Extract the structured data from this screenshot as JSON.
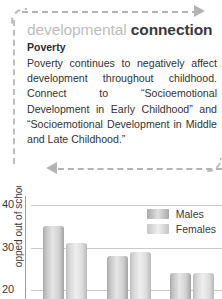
{
  "callout": {
    "heading_light": "developmental",
    "heading_bold": "connection",
    "subheading": "Poverty",
    "body": "Poverty continues to negatively affect development throughout childhood. Connect to “Socioemotional Development in Early Childhood” and “Socioemotional Development in Middle and Late Childhood.”",
    "arrow_top": "dashed-arrow-right",
    "arrow_bottom": "dashed-arrow-left",
    "border_color": "#bdbdbd"
  },
  "chart_data": {
    "type": "bar",
    "title": "",
    "xlabel": "",
    "ylabel": "opped out of school",
    "ylabel_full": "dropped out of school",
    "categories": [
      "Group 1",
      "Group 2",
      "Group 3"
    ],
    "series": [
      {
        "name": "Males",
        "values": [
          35,
          28,
          24
        ],
        "color": "#b0b0b0"
      },
      {
        "name": "Females",
        "values": [
          31,
          29,
          24
        ],
        "color": "#d2d2d2"
      }
    ],
    "yticks": [
      40,
      30,
      20
    ],
    "ylim": [
      18,
      42
    ],
    "grid": true,
    "legend_position": "top-right"
  }
}
